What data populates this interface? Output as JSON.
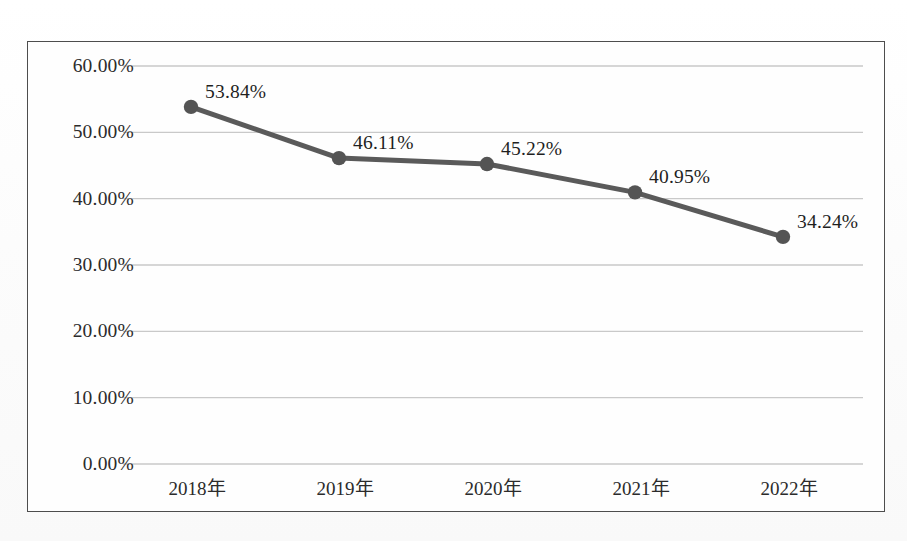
{
  "chart_data": {
    "type": "line",
    "title": "",
    "subtitle": "",
    "xlabel": "",
    "ylabel": "",
    "categories": [
      "2018年",
      "2019年",
      "2020年",
      "2021年",
      "2022年"
    ],
    "values": [
      53.84,
      46.11,
      45.22,
      40.95,
      34.24
    ],
    "point_labels": [
      "53.84%",
      "46.11%",
      "45.22%",
      "40.95%",
      "34.24%"
    ],
    "ylim": [
      0,
      60
    ],
    "ytick_values": [
      60,
      50,
      40,
      30,
      20,
      10,
      0
    ],
    "ytick_labels": [
      "60.00%",
      "50.00%",
      "40.00%",
      "30.00%",
      "20.00%",
      "10.00%",
      "0.00%"
    ],
    "grid": true,
    "grid_axis": "y",
    "legend": false,
    "legend_position": "none",
    "series": [
      {
        "name": "",
        "values": [
          53.84,
          46.11,
          45.22,
          40.95,
          34.24
        ]
      }
    ],
    "colors": {
      "line": "#5a5a5a",
      "marker": "#545454",
      "gridline": "#c9c9c9",
      "border": "#4d4d4d",
      "text": "#2b2b2b",
      "background": "#fefefe"
    },
    "marker_style": "circle",
    "line_width_px": 5
  },
  "axis": {
    "y_ticks": [
      {
        "label": "60.00%",
        "value": 60
      },
      {
        "label": "50.00%",
        "value": 50
      },
      {
        "label": "40.00%",
        "value": 40
      },
      {
        "label": "30.00%",
        "value": 30
      },
      {
        "label": "20.00%",
        "value": 20
      },
      {
        "label": "10.00%",
        "value": 10
      },
      {
        "label": "0.00%",
        "value": 0
      }
    ],
    "x_ticks": [
      {
        "label": "2018年"
      },
      {
        "label": "2019年"
      },
      {
        "label": "2020年"
      },
      {
        "label": "2021年"
      },
      {
        "label": "2022年"
      }
    ]
  }
}
